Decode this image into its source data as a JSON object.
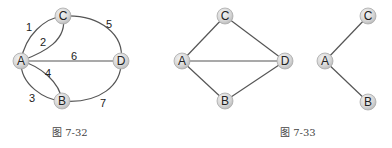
{
  "figures": [
    {
      "caption": "图 7-32",
      "nodes": [
        {
          "id": "C",
          "label": "C",
          "x": 63,
          "y": 16
        },
        {
          "id": "A",
          "label": "A",
          "x": 21,
          "y": 61
        },
        {
          "id": "D",
          "label": "D",
          "x": 121,
          "y": 61
        },
        {
          "id": "B",
          "label": "B",
          "x": 62,
          "y": 101
        }
      ],
      "edges": [
        {
          "from": "A",
          "to": "C",
          "label": "1"
        },
        {
          "from": "A",
          "to": "C",
          "label": "2"
        },
        {
          "from": "A",
          "to": "B",
          "label": "3"
        },
        {
          "from": "A",
          "to": "B",
          "label": "4"
        },
        {
          "from": "C",
          "to": "D",
          "label": "5"
        },
        {
          "from": "A",
          "to": "D",
          "label": "6"
        },
        {
          "from": "B",
          "to": "D",
          "label": "7"
        }
      ]
    },
    {
      "caption": "图 7-33",
      "graphs": [
        {
          "nodes": [
            {
              "id": "C",
              "label": "C",
              "x": 225,
              "y": 16
            },
            {
              "id": "A",
              "label": "A",
              "x": 182,
              "y": 61
            },
            {
              "id": "D",
              "label": "D",
              "x": 285,
              "y": 61
            },
            {
              "id": "B",
              "label": "B",
              "x": 225,
              "y": 101
            }
          ],
          "edges": [
            {
              "from": "A",
              "to": "C"
            },
            {
              "from": "C",
              "to": "D"
            },
            {
              "from": "A",
              "to": "D"
            },
            {
              "from": "A",
              "to": "B"
            },
            {
              "from": "B",
              "to": "D"
            }
          ]
        },
        {
          "nodes": [
            {
              "id": "C",
              "label": "C",
              "x": 368,
              "y": 16
            },
            {
              "id": "A",
              "label": "A",
              "x": 325,
              "y": 61
            },
            {
              "id": "B",
              "label": "B",
              "x": 368,
              "y": 102
            }
          ],
          "edges": [
            {
              "from": "A",
              "to": "C"
            },
            {
              "from": "A",
              "to": "B"
            }
          ]
        }
      ]
    }
  ]
}
